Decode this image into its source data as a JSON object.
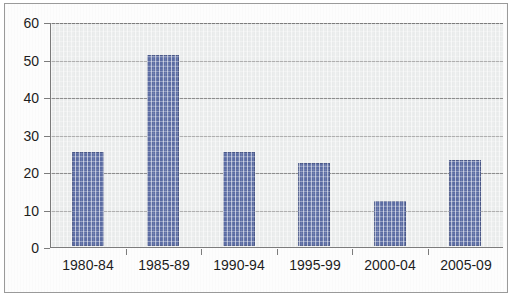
{
  "chart_data": {
    "type": "bar",
    "title": "",
    "subtitle": "",
    "xlabel": "",
    "ylabel": "",
    "categories": [
      "1980-84",
      "1985-89",
      "1990-94",
      "1995-99",
      "2000-04",
      "2005-09"
    ],
    "values": [
      25,
      51,
      25,
      22,
      12,
      23
    ],
    "ylim": [
      0,
      60
    ],
    "ytick_labels": [
      "60",
      "50",
      "40",
      "30",
      "20",
      "10",
      "0"
    ],
    "ytick_values": [
      60,
      50,
      40,
      30,
      20,
      10,
      0
    ],
    "ytick_interval": 10,
    "grid": true,
    "grid_axis": "y",
    "legend": false,
    "legend_position": "none",
    "bar_color": "#5b6ca3",
    "plot_background": "#ebeded",
    "grid_color": "#8d8d8d",
    "axis_color": "#7c7c7c",
    "frame_border_color": "#9a9a9a",
    "text_color": "#1d1d1d",
    "series": [
      {
        "name": "count",
        "values": [
          25,
          51,
          25,
          22,
          12,
          23
        ]
      }
    ]
  }
}
